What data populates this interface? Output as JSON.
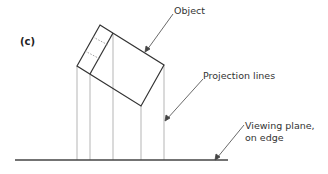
{
  "figure": {
    "panel_label": "(c)",
    "labels": {
      "object": "Object",
      "projection_lines": "Projection lines",
      "viewing_plane_line1": "Viewing plane,",
      "viewing_plane_line2": "on edge"
    },
    "colors": {
      "outline": "#333333",
      "projection": "#b0b0b0",
      "plane": "#444444",
      "leader": "#444444",
      "hidden": "#888888"
    }
  }
}
